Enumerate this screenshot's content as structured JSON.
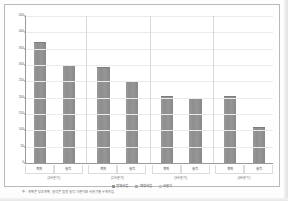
{
  "figure": {
    "caption": "주 : 계획은 당초 계획, 실적은 집행 실적 기준이며 사분기별 누계치임.",
    "panel_background": "#ffffff",
    "panel_border_color": "#b9b9b9",
    "axis_color": "#9a9a9a",
    "grid_color": "#eaeaea"
  },
  "chart_data": {
    "type": "bar",
    "title": "",
    "subtitle": "",
    "xlabel": "",
    "ylabel": "",
    "ylim": [
      0,
      450
    ],
    "grid": true,
    "legend_position": "bottom",
    "bar_color": "#8e8e8e",
    "yticks": [
      450,
      400,
      350,
      300,
      250,
      200,
      150,
      100,
      50,
      0
    ],
    "ytick_labels": [
      "450",
      "400",
      "350",
      "300",
      "250",
      "200",
      "150",
      "100",
      "50",
      "0"
    ],
    "groups": [
      {
        "label": "(1사분기)",
        "categories": [
          "계획",
          "실적"
        ]
      },
      {
        "label": "(2사분기)",
        "categories": [
          "계획",
          "실적"
        ]
      },
      {
        "label": "(3사분기)",
        "categories": [
          "계획",
          "실적"
        ]
      },
      {
        "label": "(4사분기)",
        "categories": [
          "계획",
          "실적"
        ]
      }
    ],
    "categories": [
      "계획",
      "실적",
      "계획",
      "실적",
      "계획",
      "실적",
      "계획",
      "실적"
    ],
    "values": [
      370,
      300,
      295,
      250,
      205,
      200,
      205,
      110
    ],
    "series": [
      {
        "name": "전체사업",
        "values": [
          370,
          300,
          295,
          250,
          205,
          200,
          205,
          110
        ],
        "color": "#8e8e8e"
      }
    ],
    "legend": [
      {
        "label": "전체사업",
        "color": "#8e8e8e"
      },
      {
        "label": "재정사업",
        "color": "#a8a8a8"
      },
      {
        "label": "사분기",
        "color": "#c4c4c4"
      }
    ],
    "annotations": []
  }
}
